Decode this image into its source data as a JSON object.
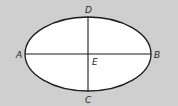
{
  "diagram": {
    "type": "ellipse-with-axes",
    "background_color": "#cfcfcf",
    "ellipse_fill": "#ffffff",
    "stroke_color": "#1a1a1a",
    "ellipse": {
      "cx": 88,
      "cy": 54,
      "rx": 63,
      "ry": 37
    },
    "points": {
      "A": {
        "label": "A",
        "x": 19,
        "y": 58
      },
      "B": {
        "label": "B",
        "x": 157,
        "y": 58
      },
      "D": {
        "label": "D",
        "x": 88,
        "y": 14
      },
      "C": {
        "label": "C",
        "x": 88,
        "y": 103
      },
      "E": {
        "label": "E",
        "x": 95,
        "y": 65
      }
    },
    "segments": [
      {
        "name": "major-axis-AB",
        "from": "A",
        "to": "B"
      },
      {
        "name": "minor-axis-DC",
        "from": "D",
        "to": "C"
      }
    ]
  }
}
